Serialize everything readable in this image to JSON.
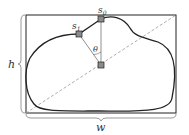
{
  "labels": {
    "s0": "s",
    "s0_sub": "0",
    "s1": "s",
    "s1_sub": "1",
    "theta": "θ",
    "height": "h",
    "width": "w"
  },
  "colors": {
    "stroke": "#222222",
    "marker_fill": "#8a8a8a",
    "dashed": "#999999"
  }
}
